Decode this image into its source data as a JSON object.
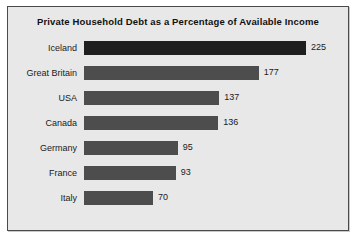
{
  "chart_data": {
    "type": "bar",
    "orientation": "horizontal",
    "title": "Private Household Debt as a Percentage of Available Income",
    "xlabel": "",
    "ylabel": "",
    "grid": false,
    "legend": null,
    "xlim": [
      0,
      225
    ],
    "categories": [
      "Iceland",
      "Great Britain",
      "USA",
      "Canada",
      "Germany",
      "France",
      "Italy"
    ],
    "values": [
      225,
      177,
      137,
      136,
      95,
      93,
      70
    ],
    "value_labels": [
      "225",
      "177",
      "137",
      "136",
      "95",
      "93",
      "70"
    ],
    "colors": {
      "bar": "#4d4d4d",
      "bar_highlight": "#1f1f1f",
      "panel_background": "#e8e8e8",
      "border": "#4a4a4a",
      "text": "#1a1a1a"
    },
    "rows": [
      {
        "category": "Iceland",
        "value": 225,
        "label": "225",
        "highlight": true
      },
      {
        "category": "Great Britain",
        "value": 177,
        "label": "177",
        "highlight": false
      },
      {
        "category": "USA",
        "value": 137,
        "label": "137",
        "highlight": false
      },
      {
        "category": "Canada",
        "value": 136,
        "label": "136",
        "highlight": false
      },
      {
        "category": "Germany",
        "value": 95,
        "label": "95",
        "highlight": false
      },
      {
        "category": "France",
        "value": 93,
        "label": "93",
        "highlight": false
      },
      {
        "category": "Italy",
        "value": 70,
        "label": "70",
        "highlight": false
      }
    ]
  }
}
